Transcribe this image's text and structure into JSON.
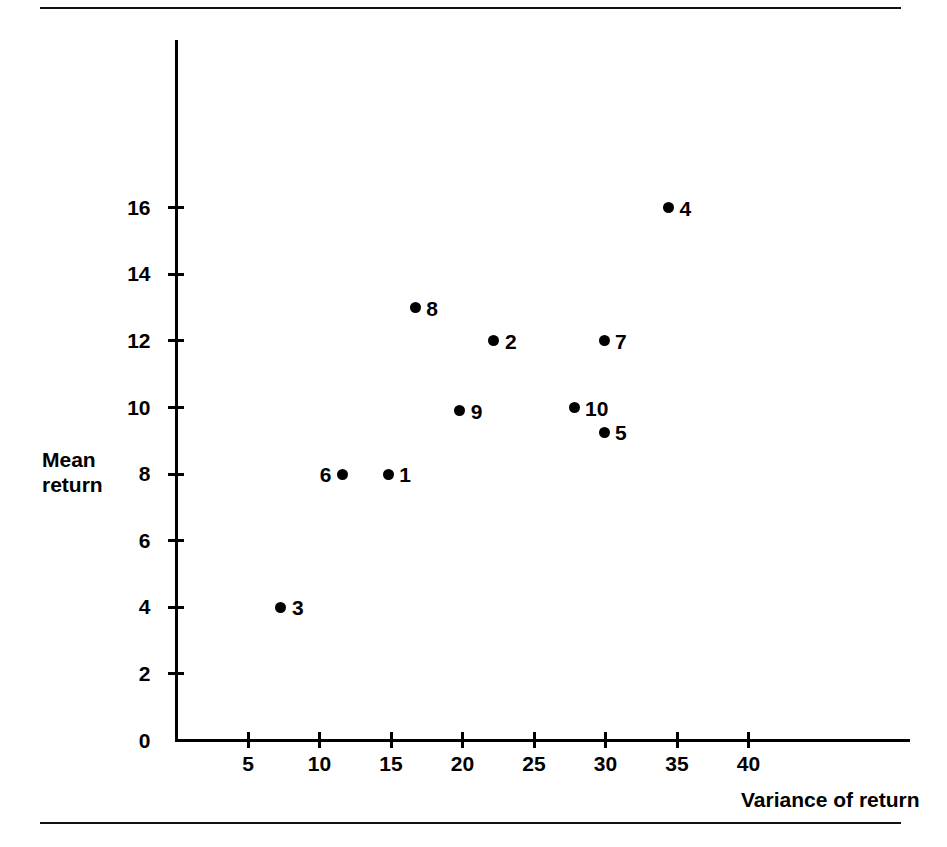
{
  "chart_data": {
    "type": "scatter",
    "title": "",
    "xlabel": "Variance of return",
    "ylabel": "Mean\nreturn",
    "xlim": [
      0,
      46
    ],
    "ylim": [
      0,
      17.5
    ],
    "grid": false,
    "legend": "none",
    "xticks": [
      5,
      10,
      15,
      20,
      25,
      30,
      35,
      40
    ],
    "xtick_labels": [
      "5",
      "10",
      "15",
      "20",
      "25",
      "30",
      "35",
      "40"
    ],
    "yticks": [
      0,
      2,
      4,
      6,
      8,
      10,
      12,
      14,
      16
    ],
    "ytick_labels": [
      "0",
      "2",
      "4",
      "6",
      "8",
      "10",
      "12",
      "14",
      "16"
    ],
    "points": [
      {
        "label": "1",
        "x": 14.8,
        "y": 8.0,
        "label_side": "right"
      },
      {
        "label": "2",
        "x": 22.2,
        "y": 12.0,
        "label_side": "right"
      },
      {
        "label": "3",
        "x": 7.3,
        "y": 4.0,
        "label_side": "right"
      },
      {
        "label": "4",
        "x": 34.4,
        "y": 16.0,
        "label_side": "right"
      },
      {
        "label": "5",
        "x": 29.9,
        "y": 9.25,
        "label_side": "right"
      },
      {
        "label": "6",
        "x": 11.6,
        "y": 8.0,
        "label_side": "left"
      },
      {
        "label": "7",
        "x": 29.9,
        "y": 12.0,
        "label_side": "right"
      },
      {
        "label": "8",
        "x": 16.7,
        "y": 13.0,
        "label_side": "right"
      },
      {
        "label": "9",
        "x": 19.8,
        "y": 9.9,
        "label_side": "right"
      },
      {
        "label": "10",
        "x": 27.8,
        "y": 10.0,
        "label_side": "right"
      }
    ]
  },
  "figure": {
    "x_axis_label": "Variance of return",
    "y_axis_label": "Mean\nreturn"
  }
}
